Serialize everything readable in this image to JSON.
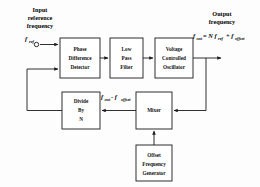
{
  "figure": {
    "background_color": "#fdfdfd",
    "line_color": "#1a1a1a"
  },
  "labels": {
    "input_title_line1": "Input",
    "input_title_line2": "reference",
    "input_title_line3": "frequency",
    "output_title_line1": "Output",
    "output_title_line2": "frequency"
  },
  "signals": {
    "input_symbol_base": "f",
    "input_symbol_sub": "ref",
    "output_eq_lhs_base": "f",
    "output_eq_lhs_sub": "out",
    "output_eq_mid": "= N f",
    "output_eq_mid_sub": "ref",
    "output_eq_plus": "+ f",
    "output_eq_tail_sub": "offset",
    "feedback_base": "f",
    "feedback_sub1": "out",
    "feedback_minus": "- f",
    "feedback_sub2": "offset"
  },
  "blocks": [
    {
      "id": "phase-difference-detector",
      "lines": [
        "Phase",
        "Difference",
        "Detector"
      ],
      "x": 60,
      "y": 38,
      "w": 40,
      "h": 40
    },
    {
      "id": "low-pass-filter",
      "lines": [
        "Low",
        "Pass",
        "Filter"
      ],
      "x": 110,
      "y": 38,
      "w": 33,
      "h": 40
    },
    {
      "id": "voltage-controlled-oscillator",
      "lines": [
        "Voltage",
        "Controlled",
        "Oscillator"
      ],
      "x": 155,
      "y": 38,
      "w": 38,
      "h": 40
    },
    {
      "id": "divide-by-n",
      "lines": [
        "Divide",
        "By",
        "N"
      ],
      "x": 62,
      "y": 92,
      "w": 38,
      "h": 37
    },
    {
      "id": "mixer",
      "lines": [
        "Mixer"
      ],
      "x": 136,
      "y": 92,
      "w": 36,
      "h": 37
    },
    {
      "id": "offset-frequency-generator",
      "lines": [
        "Offset",
        "Frequency",
        "Generator"
      ],
      "x": 136,
      "y": 145,
      "w": 36,
      "h": 36
    }
  ]
}
